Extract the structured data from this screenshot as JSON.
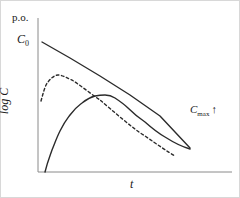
{
  "figure": {
    "width": 240,
    "height": 198,
    "background": "#ffffff",
    "border_color": "#d8d8d8",
    "line_color": "#2b2b2b",
    "text_color": "#1a1a1a"
  },
  "axes": {
    "y_axis_label": "log C",
    "x_axis_label": "t",
    "y_axis_x_px": 38,
    "y_axis_top_px": 18,
    "x_axis_y_px": 172,
    "x_axis_right_px": 232,
    "ticks": [],
    "gridlines": false
  },
  "annotations": {
    "top_left": "p.o.",
    "intercept": "C",
    "intercept_sub": "0",
    "cmax": "C",
    "cmax_sub": "max",
    "cmax_arrow": "↑"
  },
  "chart_data": {
    "type": "line",
    "title": "",
    "subtitle": "",
    "xlabel": "t",
    "ylabel": "log C",
    "xlim": [
      0,
      240
    ],
    "ylim": [
      0,
      198
    ],
    "grid": false,
    "legend_position": "none",
    "axis_scale": "semi-log",
    "series": [
      {
        "name": "iv-bolus-terminal-line",
        "style": "solid",
        "annotation": "C0",
        "points": [
          [
            42,
            42
          ],
          [
            70,
            58
          ],
          [
            100,
            76
          ],
          [
            130,
            95
          ],
          [
            160,
            116
          ],
          [
            190,
            148
          ]
        ]
      },
      {
        "name": "oral-fast-absorption",
        "style": "dashed",
        "points": [
          [
            41,
            101
          ],
          [
            44,
            90
          ],
          [
            48,
            82
          ],
          [
            53,
            77
          ],
          [
            58,
            75
          ],
          [
            64,
            76
          ],
          [
            72,
            80
          ],
          [
            84,
            88
          ],
          [
            100,
            100
          ],
          [
            120,
            117
          ],
          [
            145,
            136
          ],
          [
            175,
            156
          ]
        ]
      },
      {
        "name": "oral-slow-absorption",
        "style": "solid",
        "annotation": "Cmax",
        "points": [
          [
            45,
            172
          ],
          [
            52,
            150
          ],
          [
            60,
            131
          ],
          [
            70,
            115
          ],
          [
            82,
            103
          ],
          [
            95,
            96
          ],
          [
            105,
            95
          ],
          [
            115,
            98
          ],
          [
            128,
            108
          ],
          [
            145,
            122
          ],
          [
            165,
            137
          ],
          [
            190,
            149
          ]
        ]
      }
    ]
  }
}
